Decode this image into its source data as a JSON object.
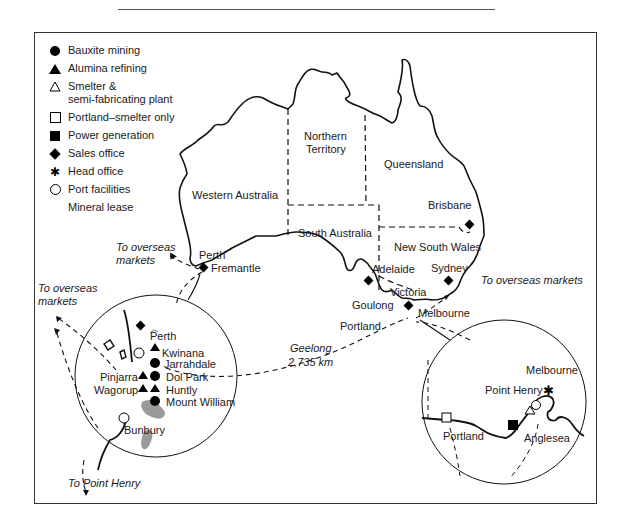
{
  "legend": {
    "items": [
      {
        "symbol": "filled-circle",
        "label": "Bauxite mining"
      },
      {
        "symbol": "filled-triangle",
        "label": "Alumina refining"
      },
      {
        "symbol": "open-triangle",
        "label": "Smelter &",
        "label2": "semi-fabricating plant"
      },
      {
        "symbol": "open-square",
        "label": "Portland–smelter only"
      },
      {
        "symbol": "filled-square",
        "label": "Power generation"
      },
      {
        "symbol": "filled-diamond",
        "label": "Sales office"
      },
      {
        "symbol": "asterisk",
        "label": "Head office"
      },
      {
        "symbol": "open-circle",
        "label": "Port facilities"
      },
      {
        "symbol": "none",
        "label": "Mineral lease"
      }
    ]
  },
  "map": {
    "regions": {
      "western_australia": "Western Australia",
      "northern_territory_1": "Northern",
      "northern_territory_2": "Territory",
      "queensland": "Queensland",
      "south_australia": "South Australia",
      "new_south_wales": "New South Wales",
      "victoria": "Victoria"
    },
    "cities": {
      "perth": "Perth",
      "fremantle": "Fremantle",
      "brisbane": "Brisbane",
      "sydney": "Sydney",
      "adelaide": "Adelaide",
      "goulong": "Goulong",
      "portland": "Portland",
      "melbourne": "Melbourne"
    },
    "annotations": {
      "overseas_wa_1": "To overseas",
      "overseas_wa_2": "markets",
      "overseas_inset_1": "To overseas",
      "overseas_inset_2": "markets",
      "overseas_east": "To overseas markets",
      "geelong": "Geelong",
      "distance": "2,735 km",
      "to_point_henry": "To Point Henry"
    }
  },
  "inset_wa": {
    "labels": {
      "perth": "Perth",
      "kwinana": "Kwinana",
      "jarrahdale": "Jarrahdale",
      "pinjarra": "Pinjarra",
      "dol_park": "Dol Park",
      "wagorup": "Wagorup",
      "huntly": "Huntly",
      "mount_william": "Mount William",
      "bunbury": "Bunbury"
    }
  },
  "inset_vic": {
    "labels": {
      "melbourne": "Melbourne",
      "point_henry": "Point Henry",
      "portland": "Portland",
      "anglesea": "Anglesea"
    }
  },
  "colors": {
    "ink": "#1a1a1a",
    "mineral_lease": "#9a9a9a",
    "frame": "#333333"
  }
}
